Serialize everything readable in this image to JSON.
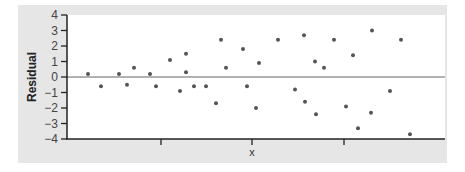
{
  "chart_data": {
    "type": "scatter",
    "title": "",
    "xlabel": "x",
    "ylabel": "Residual",
    "ylim": [
      -4,
      4
    ],
    "yticks": [
      4,
      3,
      2,
      1,
      0,
      -1,
      -2,
      -3,
      -4
    ],
    "ytick_labels": [
      "4",
      "3",
      "2",
      "1",
      "0",
      "−1",
      "−2",
      "−3",
      "−4"
    ],
    "xticks_unlabeled": 3,
    "reference_line_y": 0,
    "grid": false,
    "legend": null,
    "points": [
      {
        "x": 88,
        "y": 0.2
      },
      {
        "x": 101,
        "y": -0.6
      },
      {
        "x": 119,
        "y": 0.2
      },
      {
        "x": 127,
        "y": -0.5
      },
      {
        "x": 134,
        "y": 0.6
      },
      {
        "x": 150,
        "y": 0.2
      },
      {
        "x": 156,
        "y": -0.6
      },
      {
        "x": 170,
        "y": 1.1
      },
      {
        "x": 180,
        "y": -0.9
      },
      {
        "x": 186,
        "y": 1.5
      },
      {
        "x": 186,
        "y": 0.3
      },
      {
        "x": 194,
        "y": -0.6
      },
      {
        "x": 206,
        "y": -0.6
      },
      {
        "x": 216,
        "y": -1.7
      },
      {
        "x": 221,
        "y": 2.4
      },
      {
        "x": 226,
        "y": 0.6
      },
      {
        "x": 243,
        "y": 1.8
      },
      {
        "x": 247,
        "y": -0.6
      },
      {
        "x": 256,
        "y": -2.0
      },
      {
        "x": 259,
        "y": 0.9
      },
      {
        "x": 278,
        "y": 2.4
      },
      {
        "x": 295,
        "y": -0.8
      },
      {
        "x": 304,
        "y": 2.7
      },
      {
        "x": 305,
        "y": -1.6
      },
      {
        "x": 315,
        "y": 1.0
      },
      {
        "x": 316,
        "y": -2.4
      },
      {
        "x": 324,
        "y": 0.6
      },
      {
        "x": 334,
        "y": 2.4
      },
      {
        "x": 346,
        "y": -1.9
      },
      {
        "x": 353,
        "y": 1.4
      },
      {
        "x": 358,
        "y": -3.3
      },
      {
        "x": 371,
        "y": -2.3
      },
      {
        "x": 372,
        "y": 3.0
      },
      {
        "x": 390,
        "y": -0.9
      },
      {
        "x": 401,
        "y": 2.4
      },
      {
        "x": 410,
        "y": -3.7
      }
    ],
    "note": "x values are horizontal pixel positions (x axis has no numeric labels)"
  },
  "colors": {
    "frame": "#e6e6e6",
    "plot_bg": "#ffffff",
    "axis": "#222222",
    "point": "#555555",
    "zero_line": "#666666"
  }
}
